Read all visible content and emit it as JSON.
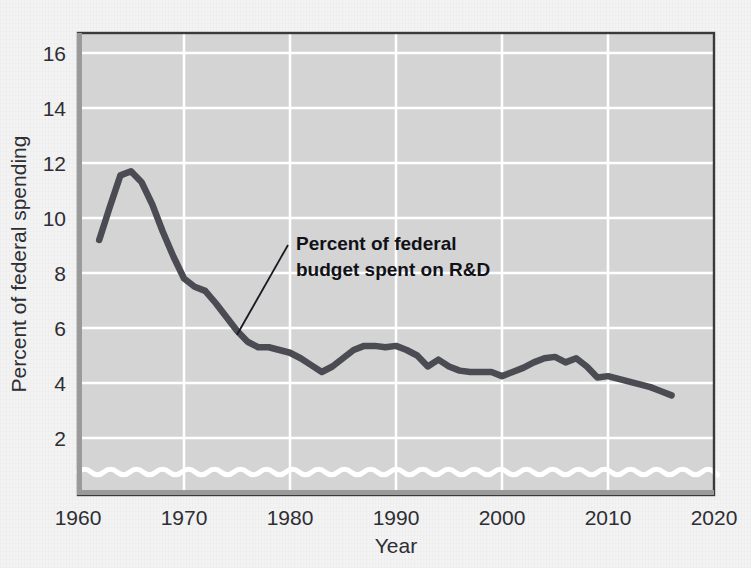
{
  "chart_data": {
    "type": "line",
    "title": "",
    "xlabel": "Year",
    "ylabel": "Percent of federal spending",
    "xlim": [
      1960,
      2020
    ],
    "ylim": [
      1,
      16
    ],
    "ytick_values": [
      2,
      4,
      6,
      8,
      10,
      12,
      14,
      16
    ],
    "ytick_labels": [
      "2",
      "4",
      "6",
      "8",
      "10",
      "12",
      "14",
      "16"
    ],
    "xtick_values": [
      1960,
      1970,
      1980,
      1990,
      2000,
      2010,
      2020
    ],
    "xtick_labels": [
      "1960",
      "1970",
      "1980",
      "1990",
      "2000",
      "2010",
      "2020"
    ],
    "grid": true,
    "legend_position": "none",
    "axis_break": "wavy-line-near-bottom",
    "plot_background_color": "#d4d4d4",
    "gridline_color": "#ffffff",
    "line_color": "#4b4b54",
    "series": [
      {
        "name": "Percent of federal budget spent on R&D",
        "x": [
          1962,
          1963,
          1964,
          1965,
          1966,
          1967,
          1968,
          1969,
          1970,
          1971,
          1972,
          1973,
          1974,
          1975,
          1976,
          1977,
          1978,
          1979,
          1980,
          1981,
          1982,
          1983,
          1984,
          1985,
          1986,
          1987,
          1988,
          1989,
          1990,
          1991,
          1992,
          1993,
          1994,
          1995,
          1996,
          1997,
          1998,
          1999,
          2000,
          2001,
          2002,
          2003,
          2004,
          2005,
          2006,
          2007,
          2008,
          2009,
          2010,
          2011,
          2012,
          2013,
          2014,
          2015,
          2016
        ],
        "values": [
          9.2,
          10.4,
          11.55,
          11.7,
          11.3,
          10.5,
          9.5,
          8.6,
          7.8,
          7.5,
          7.35,
          6.9,
          6.4,
          5.9,
          5.5,
          5.3,
          5.3,
          5.2,
          5.1,
          4.9,
          4.65,
          4.4,
          4.6,
          4.9,
          5.2,
          5.35,
          5.35,
          5.3,
          5.35,
          5.2,
          5.0,
          4.6,
          4.85,
          4.6,
          4.45,
          4.4,
          4.4,
          4.4,
          4.25,
          4.4,
          4.55,
          4.75,
          4.9,
          4.95,
          4.75,
          4.9,
          4.6,
          4.2,
          4.25,
          4.15,
          4.05,
          3.95,
          3.85,
          3.7,
          3.55
        ]
      }
    ],
    "annotations": [
      {
        "text_line1": "Percent of federal",
        "text_line2": "budget spent on R&D",
        "points_to_x": 1975,
        "points_to_y": 5.9
      }
    ]
  }
}
